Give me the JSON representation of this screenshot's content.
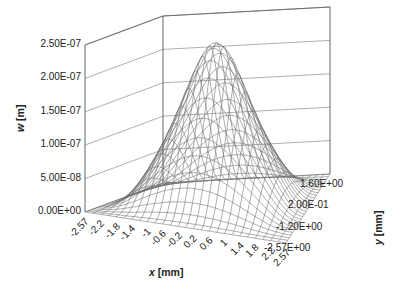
{
  "chart_data": {
    "type": "surface3d",
    "title": "",
    "xlabel": "x [mm]",
    "ylabel": "y [mm]",
    "zlabel": "w [m]",
    "x_ticks": [
      "-2.57",
      "-2.2",
      "-1.8",
      "-1.4",
      "-1",
      "-0.6",
      "-0.2",
      "0.2",
      "0.6",
      "1",
      "1.4",
      "1.8",
      "2.2",
      "2.57"
    ],
    "y_ticks": [
      "1.60E+00",
      "2.00E-01",
      "-1.20E+00",
      "-2.57E+00"
    ],
    "z_ticks": [
      "0.00E+00",
      "5.00E-08",
      "1.00E-07",
      "1.50E-07",
      "2.00E-07",
      "2.50E-07"
    ],
    "xlim": [
      -2.57,
      2.57
    ],
    "ylim": [
      -2.57,
      2.57
    ],
    "zlim": [
      0,
      2.5e-07
    ],
    "surface": {
      "shape": "single central bump (plate deflection)",
      "peak_value": 2.4e-07,
      "peak_location": [
        0,
        0
      ],
      "edge_value": 0,
      "grid_resolution": [
        27,
        27
      ]
    },
    "grid": true,
    "legend": null
  },
  "axes": {
    "z_title_parts": {
      "var": "w",
      "unit": "[m]"
    },
    "x_title_parts": {
      "var": "x",
      "unit": "[mm]"
    },
    "y_title_parts": {
      "var": "y",
      "unit": "[mm]"
    }
  }
}
